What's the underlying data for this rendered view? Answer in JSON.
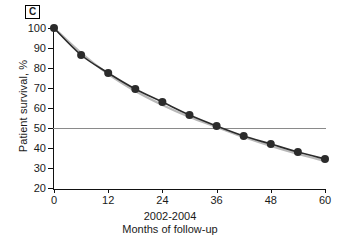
{
  "panel": {
    "label": "C"
  },
  "chart_data": {
    "type": "line",
    "title": "",
    "subtitle": "",
    "xlabel": "Months of follow-up",
    "xlabel_secondary": "2002-2004",
    "ylabel": "Patient survival, %",
    "xlim": [
      0,
      60
    ],
    "ylim": [
      20,
      100
    ],
    "xticks": [
      0,
      12,
      24,
      36,
      48,
      60
    ],
    "yticks": [
      20,
      30,
      40,
      50,
      60,
      70,
      80,
      90,
      100
    ],
    "grid": false,
    "legend": "none",
    "reference_lines": [
      {
        "name": "median-survival-line",
        "axis": "y",
        "value": 50,
        "color": "#8a8a8a"
      }
    ],
    "x": [
      0,
      6,
      12,
      18,
      24,
      30,
      36,
      42,
      48,
      54,
      60
    ],
    "series": [
      {
        "name": "observed-survival",
        "color": "#2b2b2b",
        "marker": "circle",
        "values": [
          100,
          86.5,
          77.5,
          69.5,
          63,
          56.5,
          51,
          46,
          42,
          38,
          34.5
        ]
      },
      {
        "name": "expected-survival",
        "color": "#b8b8b8",
        "marker": "none",
        "values": [
          100,
          87.5,
          77,
          68.5,
          61.5,
          55.5,
          50.5,
          45.5,
          41,
          37,
          33.5
        ]
      }
    ]
  }
}
